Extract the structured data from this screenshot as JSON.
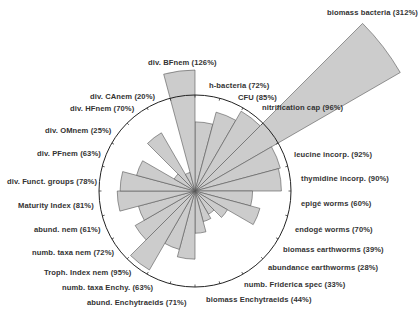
{
  "chart_data": {
    "type": "rose",
    "title": "",
    "reference_circle_pct": 100,
    "center": [
      195,
      191
    ],
    "radius_px_per_100pct": 96,
    "max_drawn_radius_px": 237,
    "wedge_fill": "#cccccc",
    "wedge_stroke": "#555555",
    "start_angle_deg": 0,
    "categories": [
      "h-bacteria",
      "CFU",
      "nitrification cap",
      "biomass bacteria",
      "leucine incorp.",
      "thymidine incorp.",
      "epigé worms",
      "endogé worms",
      "biomass earthworms",
      "abundance earthworms",
      "numb. Friderica spec",
      "biomass Enchytraeids",
      "abund. Enchytraeids",
      "numb. taxa Enchy.",
      "Troph. Index nem",
      "numb. taxa nem",
      "abund. nem",
      "Maturity Index",
      "div. Funct. groups",
      "div. PFnem",
      "div. OMnem",
      "div. HFnem",
      "div. CAnem",
      "div. BFnem"
    ],
    "values": [
      72,
      85,
      96,
      312,
      92,
      90,
      60,
      70,
      39,
      28,
      33,
      44,
      71,
      63,
      95,
      72,
      61,
      81,
      78,
      63,
      25,
      70,
      20,
      126
    ],
    "unit": "%"
  },
  "labels": [
    {
      "text": "biomass bacteria (312%)",
      "x": 327,
      "y": 8
    },
    {
      "text": "div. BFnem (126%)",
      "x": 148,
      "y": 58
    },
    {
      "text": "h-bacteria (72%)",
      "x": 209,
      "y": 81
    },
    {
      "text": "div. CAnem (20%)",
      "x": 90,
      "y": 92
    },
    {
      "text": "CFU (85%)",
      "x": 238,
      "y": 93
    },
    {
      "text": "div. HFnem (70%)",
      "x": 70,
      "y": 104
    },
    {
      "text": "nitrification cap (96%)",
      "x": 262,
      "y": 103
    },
    {
      "text": "div. OMnem (25%)",
      "x": 45,
      "y": 126
    },
    {
      "text": "div. PFnem (63%)",
      "x": 37,
      "y": 149
    },
    {
      "text": "leucine incorp. (92%)",
      "x": 294,
      "y": 150
    },
    {
      "text": "thymidine incorp. (90%)",
      "x": 301,
      "y": 174
    },
    {
      "text": "div. Funct. groups (78%)",
      "x": 7,
      "y": 177
    },
    {
      "text": "epigé worms (60%)",
      "x": 301,
      "y": 199
    },
    {
      "text": "Maturity Index (81%)",
      "x": 18,
      "y": 201
    },
    {
      "text": "abund. nem (61%)",
      "x": 34,
      "y": 225
    },
    {
      "text": "endogé worms (70%)",
      "x": 295,
      "y": 225
    },
    {
      "text": "biomass earthworms (39%)",
      "x": 283,
      "y": 245
    },
    {
      "text": "numb. taxa nem (72%)",
      "x": 32,
      "y": 248
    },
    {
      "text": "abundance earthworms (28%)",
      "x": 268,
      "y": 263
    },
    {
      "text": "Troph. Index nem (95%)",
      "x": 44,
      "y": 268
    },
    {
      "text": "numb. Friderica spec (33%)",
      "x": 244,
      "y": 280
    },
    {
      "text": "numb. taxa Enchy. (63%)",
      "x": 62,
      "y": 283
    },
    {
      "text": "abund. Enchytraeids (71%)",
      "x": 87,
      "y": 298
    },
    {
      "text": "biomass Enchytraeids (44%)",
      "x": 206,
      "y": 295
    }
  ]
}
